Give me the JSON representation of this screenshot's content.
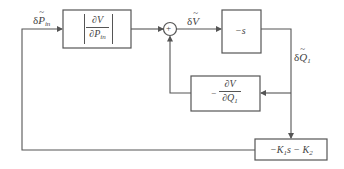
{
  "diagram": {
    "type": "block-diagram",
    "blocks": {
      "gain_pin": {
        "numerator": "∂V",
        "denominator_prefix": "∂P",
        "denominator_sub": "in",
        "absolute_value": true
      },
      "integrator": {
        "label": "−s"
      },
      "feedback_q": {
        "sign": "−",
        "numerator": "∂V",
        "denominator_prefix": "∂Q",
        "denominator_sub": "1"
      },
      "controller": {
        "label_part1": "−K",
        "sub1": "1",
        "label_part2": "s − K",
        "sub2": "2"
      }
    },
    "summing_junction": {
      "symbol": "+"
    },
    "signals": {
      "input": {
        "prefix": "δ",
        "var": "P",
        "sub": "in"
      },
      "sum_out": {
        "prefix": "δ",
        "var": "V"
      },
      "output": {
        "prefix": "δ",
        "var": "Q",
        "sub": "1"
      }
    },
    "colors": {
      "line": "#555555",
      "text": "#444444",
      "background": "#ffffff"
    }
  }
}
